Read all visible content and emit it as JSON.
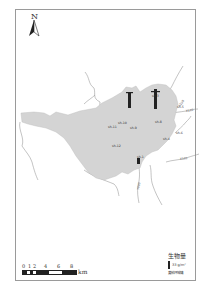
{
  "map": {
    "north_label": "N",
    "scale": {
      "ticks": [
        "0",
        "1",
        "2",
        "4",
        "6",
        "8"
      ],
      "unit": "km"
    },
    "legend": {
      "title": "生物量",
      "value_label": "33 g/m²",
      "subtitle": "黄柏坪城镇"
    },
    "colors": {
      "region_fill": "#d4d4d4",
      "river": "#888888",
      "bar": "#222222",
      "frame": "#9a9a9a"
    },
    "sites": [
      {
        "label": "sh-1",
        "x": 138,
        "y": 161
      },
      {
        "label": "sh-3",
        "x": 154,
        "y": 97
      },
      {
        "label": "sh-4",
        "x": 164,
        "y": 133
      },
      {
        "label": "sh-5",
        "x": 178,
        "y": 107
      },
      {
        "label": "sh-6",
        "x": 177,
        "y": 130
      },
      {
        "label": "sh-8",
        "x": 157,
        "y": 121
      },
      {
        "label": "sh-9",
        "x": 132,
        "y": 127
      },
      {
        "label": "sh-10",
        "x": 117,
        "y": 120
      },
      {
        "label": "sh-11",
        "x": 104,
        "y": 126
      },
      {
        "label": "sh-12",
        "x": 113,
        "y": 140
      },
      {
        "label": "sh-2",
        "x": 137,
        "y": 158
      }
    ],
    "bars": [
      {
        "x": 129,
        "y": 91,
        "height": 16
      },
      {
        "x": 154,
        "y": 89,
        "height": 20
      },
      {
        "x": 137,
        "y": 158,
        "height": 5
      }
    ],
    "roads": [
      {
        "label": "S108",
        "x": 190,
        "y": 105
      },
      {
        "label": "X102",
        "x": 193,
        "y": 124
      },
      {
        "label": "X101",
        "x": 175,
        "y": 159
      },
      {
        "label": "Y003",
        "x": 138,
        "y": 180
      }
    ]
  }
}
